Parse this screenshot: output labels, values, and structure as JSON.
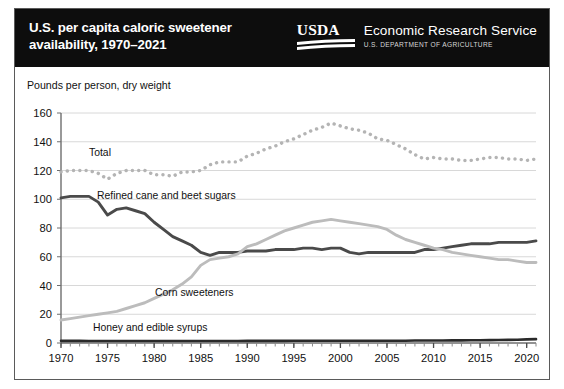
{
  "banner": {
    "title": "U.S. per capita caloric sweetener\navailability, 1970–2021",
    "usda_wordmark": "USDA",
    "agency_name": "Economic Research Service",
    "agency_department": "U.S. DEPARTMENT OF AGRICULTURE"
  },
  "colors": {
    "banner_background": "#0d0d0d",
    "banner_text": "#ffffff",
    "total_line": "#b4b4b4",
    "refined_line": "#4a4a4a",
    "corn_line": "#bcbcbc",
    "honey_line": "#2a2a2a",
    "gridline": "#d8d8d8",
    "axis": "#6e6e6e",
    "frame": "#5a5a5a"
  },
  "chart_data": {
    "type": "line",
    "title": "U.S. per capita caloric sweetener availability, 1970–2021",
    "ylabel": "Pounds per person, dry weight",
    "xlabel": "",
    "ylim": [
      0,
      160
    ],
    "yticks": [
      0,
      20,
      40,
      60,
      80,
      100,
      120,
      140,
      160
    ],
    "xlim": [
      1970,
      2021
    ],
    "xticks": [
      1970,
      1975,
      1980,
      1985,
      1990,
      1995,
      2000,
      2005,
      2010,
      2015,
      2020
    ],
    "minor_xtick_interval": 1,
    "grid": "horizontal",
    "legend": "inline-labels",
    "x": [
      1970,
      1971,
      1972,
      1973,
      1974,
      1975,
      1976,
      1977,
      1978,
      1979,
      1980,
      1981,
      1982,
      1983,
      1984,
      1985,
      1986,
      1987,
      1988,
      1989,
      1990,
      1991,
      1992,
      1993,
      1994,
      1995,
      1996,
      1997,
      1998,
      1999,
      2000,
      2001,
      2002,
      2003,
      2004,
      2005,
      2006,
      2007,
      2008,
      2009,
      2010,
      2011,
      2012,
      2013,
      2014,
      2015,
      2016,
      2017,
      2018,
      2019,
      2020,
      2021
    ],
    "series": [
      {
        "name": "Total",
        "style": "dotted",
        "color": "#b4b4b4",
        "values": [
          119,
          120,
          120,
          120,
          118,
          114,
          118,
          120,
          120,
          120,
          117,
          117,
          116,
          119,
          119,
          120,
          124,
          126,
          126,
          126,
          130,
          132,
          135,
          137,
          140,
          142,
          145,
          148,
          150,
          153,
          151,
          149,
          148,
          146,
          142,
          141,
          138,
          135,
          131,
          128,
          129,
          128,
          128,
          127,
          127,
          128,
          129,
          129,
          128,
          128,
          127,
          128
        ]
      },
      {
        "name": "Refined cane and beet sugars",
        "style": "solid",
        "color": "#4a4a4a",
        "values": [
          101,
          102,
          102,
          102,
          98,
          89,
          93,
          94,
          92,
          90,
          84,
          79,
          74,
          71,
          68,
          63,
          61,
          63,
          63,
          63,
          64,
          64,
          64,
          65,
          65,
          65,
          66,
          66,
          65,
          66,
          66,
          63,
          62,
          63,
          63,
          63,
          63,
          63,
          63,
          65,
          65,
          66,
          67,
          68,
          69,
          69,
          69,
          70,
          70,
          70,
          70,
          71
        ]
      },
      {
        "name": "Corn sweeteners",
        "style": "solid",
        "color": "#bcbcbc",
        "values": [
          16,
          17,
          18,
          19,
          20,
          21,
          22,
          24,
          26,
          28,
          31,
          34,
          37,
          41,
          46,
          54,
          58,
          59,
          60,
          62,
          67,
          69,
          72,
          75,
          78,
          80,
          82,
          84,
          85,
          86,
          85,
          84,
          83,
          82,
          81,
          79,
          75,
          72,
          70,
          68,
          66,
          65,
          63,
          62,
          61,
          60,
          59,
          58,
          58,
          57,
          56,
          56
        ]
      },
      {
        "name": "Honey and edible syrups",
        "style": "solid",
        "color": "#2a2a2a",
        "values": [
          1.5,
          1.5,
          1.5,
          1.4,
          1.4,
          1.4,
          1.4,
          1.4,
          1.4,
          1.4,
          1.4,
          1.4,
          1.4,
          1.4,
          1.4,
          1.4,
          1.4,
          1.4,
          1.4,
          1.4,
          1.5,
          1.5,
          1.5,
          1.5,
          1.5,
          1.6,
          1.6,
          1.6,
          1.6,
          1.6,
          1.6,
          1.6,
          1.6,
          1.6,
          1.6,
          1.6,
          1.6,
          1.6,
          1.7,
          1.7,
          1.7,
          1.7,
          1.8,
          1.8,
          1.9,
          1.9,
          2.0,
          2.1,
          2.2,
          2.3,
          2.5,
          2.7
        ]
      }
    ],
    "series_labels": [
      {
        "key": "total",
        "text": "Total"
      },
      {
        "key": "refined",
        "text": "Refined cane and beet sugars"
      },
      {
        "key": "corn",
        "text": "Corn sweeteners"
      },
      {
        "key": "honey",
        "text": "Honey and edible syrups"
      }
    ]
  }
}
